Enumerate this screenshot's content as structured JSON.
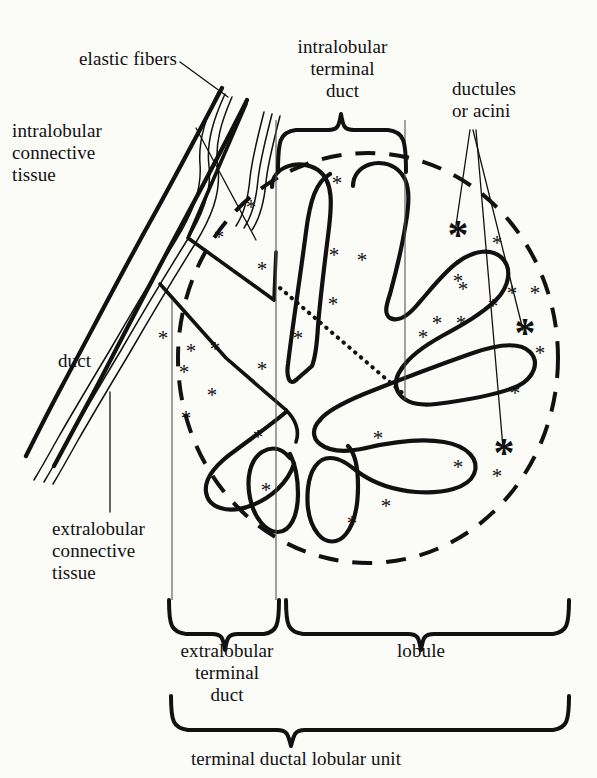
{
  "figure": {
    "title": "terminal ductal lobular unit",
    "type": "anatomical-diagram",
    "background_color": "#fbfbf8",
    "ink_color": "#111111"
  },
  "labels": {
    "elastic_fibers": "elastic fibers",
    "intralobular_connective_tissue": "intralobular\nconnective\ntissue",
    "intralobular_terminal_duct": "intralobular\nterminal\nduct",
    "ductules_or_acini": "ductules\nor acini",
    "duct": "duct",
    "extralobular_connective_tissue": "extralobular\nconnective\ntissue",
    "extralobular_terminal_duct": "extralobular\nterminal\nduct",
    "lobule": "lobule",
    "terminal_ductal_lobular_unit": "terminal ductal lobular unit"
  },
  "braces": [
    {
      "name": "intralobular-terminal-duct-brace",
      "orientation": "down",
      "label": "intralobular terminal duct"
    },
    {
      "name": "extralobular-terminal-duct-brace",
      "orientation": "up",
      "label": "extralobular terminal duct"
    },
    {
      "name": "lobule-brace",
      "orientation": "up",
      "label": "lobule"
    },
    {
      "name": "terminal-ductal-lobular-unit-brace",
      "orientation": "up",
      "label": "terminal ductal lobular unit"
    }
  ],
  "features": {
    "lobule_boundary_style": "dashed circle",
    "duct_lumen_style": "dotted line",
    "acini_marker": "large asterisk",
    "stroma_marker": "small asterisk",
    "acini_count": 3,
    "leader_lines_ductules": 3
  }
}
